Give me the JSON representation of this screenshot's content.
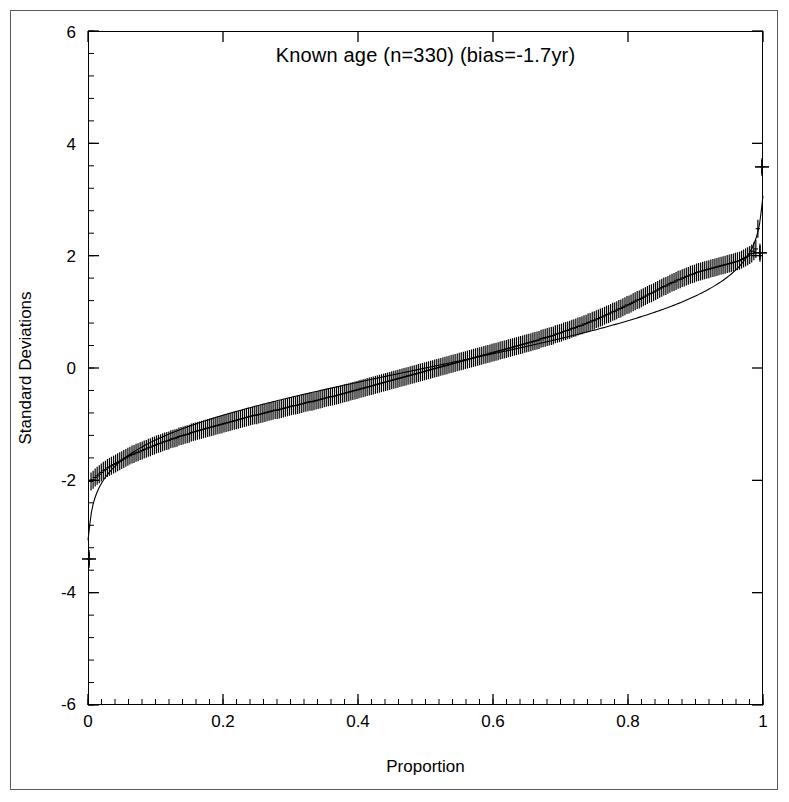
{
  "figure": {
    "width": 789,
    "height": 802,
    "background": "#ffffff",
    "border_color": "#5a5a5a"
  },
  "chart_data": {
    "type": "line",
    "title": "Known age (n=330) (bias=-1.7yr)",
    "xlabel": "Proportion",
    "ylabel": "Standard Deviations",
    "xlim": [
      0,
      1
    ],
    "ylim": [
      -6,
      6
    ],
    "xticks": [
      0,
      0.2,
      0.4,
      0.6,
      0.8,
      1
    ],
    "xtick_labels": [
      "0",
      "0.2",
      "0.4",
      "0.6",
      "0.8",
      "1"
    ],
    "yticks": [
      6,
      4,
      2,
      0,
      -2,
      -4,
      -6
    ],
    "ytick_labels": [
      "6",
      "4",
      "2",
      "0",
      "-2",
      "-4",
      "-6"
    ],
    "x_minor_tick_interval": 0.02,
    "y_minor_tick_interval": 0.4,
    "grid": false,
    "legend": null,
    "n_points": 330,
    "bias_years": -1.7,
    "marker": "plus-with-vertical-error-bars",
    "series": [
      {
        "name": "Observed standardized residuals",
        "style": "points-with-error-bars",
        "color": "#000000",
        "x": [
          0.0015,
          0.0045,
          0.0076,
          0.0106,
          0.0136,
          0.0167,
          0.0197,
          0.0227,
          0.0258,
          0.0288,
          0.0318,
          0.0348,
          0.0379,
          0.0409,
          0.0439,
          0.047,
          0.05,
          0.053,
          0.0561,
          0.0591,
          0.0621,
          0.0652,
          0.0682,
          0.0712,
          0.0742,
          0.0773,
          0.0803,
          0.0833,
          0.0864,
          0.0894,
          0.0924,
          0.0955,
          0.0985,
          0.1015,
          0.1045,
          0.1076,
          0.1106,
          0.1136,
          0.1167,
          0.1197,
          0.1227,
          0.1258,
          0.1288,
          0.1318,
          0.1348,
          0.1379,
          0.1409,
          0.1439,
          0.147,
          0.15,
          0.153,
          0.1561,
          0.1591,
          0.1621,
          0.1652,
          0.1682,
          0.1712,
          0.1742,
          0.1773,
          0.1803,
          0.1833,
          0.1864,
          0.1894,
          0.1924,
          0.1955,
          0.1985,
          0.2015,
          0.2045,
          0.2076,
          0.2106,
          0.2136,
          0.2167,
          0.2197,
          0.2227,
          0.2258,
          0.2288,
          0.2318,
          0.2348,
          0.2379,
          0.2409,
          0.2439,
          0.247,
          0.25,
          0.253,
          0.2561,
          0.2591,
          0.2621,
          0.2652,
          0.2682,
          0.2712,
          0.2742,
          0.2773,
          0.2803,
          0.2833,
          0.2864,
          0.2894,
          0.2924,
          0.2955,
          0.2985,
          0.3015,
          0.3045,
          0.3076,
          0.3106,
          0.3136,
          0.3167,
          0.3197,
          0.3227,
          0.3258,
          0.3288,
          0.3318,
          0.3348,
          0.3379,
          0.3409,
          0.3439,
          0.347,
          0.35,
          0.353,
          0.3561,
          0.3591,
          0.3621,
          0.3652,
          0.3682,
          0.3712,
          0.3742,
          0.3773,
          0.3803,
          0.3833,
          0.3864,
          0.3894,
          0.3924,
          0.3955,
          0.3985,
          0.4015,
          0.4045,
          0.4076,
          0.4106,
          0.4136,
          0.4167,
          0.4197,
          0.4227,
          0.4258,
          0.4288,
          0.4318,
          0.4348,
          0.4379,
          0.4409,
          0.4439,
          0.447,
          0.45,
          0.453,
          0.4561,
          0.4591,
          0.4621,
          0.4652,
          0.4682,
          0.4712,
          0.4742,
          0.4773,
          0.4803,
          0.4833,
          0.4864,
          0.4894,
          0.4924,
          0.4955,
          0.4985,
          0.5015,
          0.5045,
          0.5076,
          0.5106,
          0.5136,
          0.5167,
          0.5197,
          0.5227,
          0.5258,
          0.5288,
          0.5318,
          0.5348,
          0.5379,
          0.5409,
          0.5439,
          0.547,
          0.55,
          0.553,
          0.5561,
          0.5591,
          0.5621,
          0.5652,
          0.5682,
          0.5712,
          0.5742,
          0.5773,
          0.5803,
          0.5833,
          0.5864,
          0.5894,
          0.5924,
          0.5955,
          0.5985,
          0.6015,
          0.6045,
          0.6076,
          0.6106,
          0.6136,
          0.6167,
          0.6197,
          0.6227,
          0.6258,
          0.6288,
          0.6318,
          0.6348,
          0.6379,
          0.6409,
          0.6439,
          0.647,
          0.65,
          0.653,
          0.6561,
          0.6591,
          0.6621,
          0.6652,
          0.6682,
          0.6712,
          0.6742,
          0.6773,
          0.6803,
          0.6833,
          0.6864,
          0.6894,
          0.6924,
          0.6955,
          0.6985,
          0.7015,
          0.7045,
          0.7076,
          0.7106,
          0.7136,
          0.7167,
          0.7197,
          0.7227,
          0.7258,
          0.7288,
          0.7318,
          0.7348,
          0.7379,
          0.7409,
          0.7439,
          0.747,
          0.75,
          0.753,
          0.7561,
          0.7591,
          0.7621,
          0.7652,
          0.7682,
          0.7712,
          0.7742,
          0.7773,
          0.7803,
          0.7833,
          0.7864,
          0.7894,
          0.7924,
          0.7955,
          0.7985,
          0.8015,
          0.8045,
          0.8076,
          0.8106,
          0.8136,
          0.8167,
          0.8197,
          0.8227,
          0.8258,
          0.8288,
          0.8318,
          0.8348,
          0.8379,
          0.8409,
          0.8439,
          0.847,
          0.85,
          0.853,
          0.8561,
          0.8591,
          0.8621,
          0.8652,
          0.8682,
          0.8712,
          0.8742,
          0.8773,
          0.8803,
          0.8833,
          0.8864,
          0.8894,
          0.8924,
          0.8955,
          0.8985,
          0.9015,
          0.9045,
          0.9076,
          0.9106,
          0.9136,
          0.9167,
          0.9197,
          0.9227,
          0.9258,
          0.9288,
          0.9318,
          0.9348,
          0.9379,
          0.9409,
          0.9439,
          0.947,
          0.95,
          0.953,
          0.9561,
          0.9591,
          0.9621,
          0.9652,
          0.9682,
          0.9712,
          0.9742,
          0.9773,
          0.9803,
          0.9833,
          0.9864,
          0.9894,
          0.9924,
          0.9955,
          0.9985
        ],
        "y": [
          -3.4,
          -2.02,
          -1.99,
          -1.95,
          -1.92,
          -1.89,
          -1.86,
          -1.83,
          -1.81,
          -1.78,
          -1.76,
          -1.74,
          -1.72,
          -1.7,
          -1.68,
          -1.66,
          -1.64,
          -1.62,
          -1.6,
          -1.58,
          -1.56,
          -1.54,
          -1.53,
          -1.51,
          -1.5,
          -1.48,
          -1.47,
          -1.45,
          -1.44,
          -1.42,
          -1.41,
          -1.39,
          -1.38,
          -1.36,
          -1.35,
          -1.34,
          -1.32,
          -1.31,
          -1.3,
          -1.29,
          -1.27,
          -1.26,
          -1.25,
          -1.24,
          -1.22,
          -1.21,
          -1.2,
          -1.19,
          -1.18,
          -1.17,
          -1.15,
          -1.14,
          -1.13,
          -1.12,
          -1.11,
          -1.1,
          -1.09,
          -1.08,
          -1.07,
          -1.06,
          -1.05,
          -1.04,
          -1.03,
          -1.02,
          -1.01,
          -1.0,
          -0.99,
          -0.98,
          -0.97,
          -0.96,
          -0.95,
          -0.94,
          -0.93,
          -0.92,
          -0.91,
          -0.9,
          -0.89,
          -0.88,
          -0.87,
          -0.86,
          -0.85,
          -0.84,
          -0.84,
          -0.83,
          -0.82,
          -0.81,
          -0.8,
          -0.79,
          -0.78,
          -0.77,
          -0.76,
          -0.75,
          -0.75,
          -0.74,
          -0.73,
          -0.72,
          -0.71,
          -0.7,
          -0.69,
          -0.68,
          -0.67,
          -0.67,
          -0.66,
          -0.65,
          -0.64,
          -0.63,
          -0.62,
          -0.61,
          -0.6,
          -0.6,
          -0.59,
          -0.58,
          -0.57,
          -0.56,
          -0.55,
          -0.54,
          -0.53,
          -0.52,
          -0.51,
          -0.51,
          -0.5,
          -0.49,
          -0.48,
          -0.47,
          -0.46,
          -0.45,
          -0.44,
          -0.43,
          -0.42,
          -0.41,
          -0.4,
          -0.39,
          -0.38,
          -0.37,
          -0.36,
          -0.35,
          -0.34,
          -0.33,
          -0.32,
          -0.31,
          -0.3,
          -0.29,
          -0.28,
          -0.27,
          -0.26,
          -0.25,
          -0.24,
          -0.23,
          -0.22,
          -0.21,
          -0.2,
          -0.19,
          -0.18,
          -0.17,
          -0.16,
          -0.15,
          -0.14,
          -0.13,
          -0.12,
          -0.11,
          -0.1,
          -0.09,
          -0.08,
          -0.07,
          -0.06,
          -0.05,
          -0.04,
          -0.03,
          -0.02,
          -0.01,
          0.0,
          0.01,
          0.02,
          0.03,
          0.04,
          0.05,
          0.06,
          0.07,
          0.08,
          0.09,
          0.1,
          0.11,
          0.12,
          0.13,
          0.14,
          0.15,
          0.16,
          0.17,
          0.18,
          0.19,
          0.2,
          0.21,
          0.22,
          0.23,
          0.24,
          0.25,
          0.26,
          0.27,
          0.28,
          0.29,
          0.3,
          0.31,
          0.32,
          0.33,
          0.34,
          0.35,
          0.36,
          0.37,
          0.38,
          0.39,
          0.4,
          0.41,
          0.42,
          0.43,
          0.44,
          0.45,
          0.46,
          0.47,
          0.48,
          0.49,
          0.5,
          0.52,
          0.53,
          0.54,
          0.55,
          0.56,
          0.57,
          0.58,
          0.6,
          0.61,
          0.62,
          0.63,
          0.65,
          0.66,
          0.67,
          0.68,
          0.7,
          0.71,
          0.72,
          0.74,
          0.75,
          0.76,
          0.78,
          0.79,
          0.81,
          0.82,
          0.84,
          0.85,
          0.87,
          0.88,
          0.9,
          0.91,
          0.93,
          0.95,
          0.96,
          0.98,
          1.0,
          1.01,
          1.03,
          1.05,
          1.06,
          1.08,
          1.1,
          1.12,
          1.13,
          1.15,
          1.17,
          1.19,
          1.21,
          1.22,
          1.24,
          1.26,
          1.28,
          1.3,
          1.32,
          1.33,
          1.35,
          1.37,
          1.39,
          1.41,
          1.43,
          1.45,
          1.46,
          1.48,
          1.5,
          1.52,
          1.53,
          1.55,
          1.57,
          1.58,
          1.6,
          1.61,
          1.63,
          1.64,
          1.66,
          1.67,
          1.68,
          1.7,
          1.71,
          1.72,
          1.73,
          1.74,
          1.75,
          1.76,
          1.77,
          1.78,
          1.79,
          1.8,
          1.81,
          1.82,
          1.83,
          1.84,
          1.85,
          1.86,
          1.87,
          1.88,
          1.89,
          1.9,
          1.91,
          1.93,
          1.95,
          1.97,
          1.99,
          2.01,
          2.04,
          2.08,
          2.12,
          2.48,
          2.05,
          3.58
        ],
        "error_halfwidth": 0.16
      },
      {
        "name": "Expected normal quantile curve",
        "style": "smooth-line",
        "color": "#000000",
        "description": "Theoretical reference curve running from about -2.3 at proportion 0 to about +2.5 at proportion 1, lying slightly below the observed band across the middle and right of the plot."
      }
    ]
  }
}
